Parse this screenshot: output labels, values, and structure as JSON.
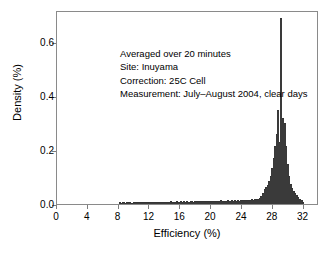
{
  "chart_data": {
    "type": "bar",
    "title": "",
    "subtitle": "",
    "xlabel": "Efficiency (%)",
    "ylabel": "Density (%)",
    "xlim": [
      0,
      34
    ],
    "ylim": [
      0.0,
      0.72
    ],
    "xticks": [
      0,
      4,
      8,
      12,
      16,
      20,
      24,
      28,
      32
    ],
    "xtick_labels": [
      "0",
      "4",
      "8",
      "12",
      "16",
      "20",
      "24",
      "28",
      "32"
    ],
    "yticks": [
      0.0,
      0.2,
      0.4,
      0.6
    ],
    "ytick_labels": [
      "0.0",
      "0.2",
      "0.4",
      "0.6"
    ],
    "grid": false,
    "legend": null,
    "bar_color": "#9a9a9a",
    "bar_edge_color": "#2e2e2e",
    "bin_width": 0.2,
    "annotations": [
      "Averaged over 20 minutes",
      "Site: Inuyama",
      "Correction: 25C Cell",
      "Measurement: July–August 2004, clear days"
    ],
    "x": [
      8.0,
      8.2,
      8.4,
      8.6,
      8.8,
      9.0,
      9.2,
      9.4,
      9.6,
      9.8,
      10.0,
      10.2,
      10.4,
      10.6,
      10.8,
      11.0,
      11.2,
      11.4,
      11.6,
      11.8,
      12.0,
      12.2,
      12.4,
      12.6,
      12.8,
      13.0,
      13.2,
      13.4,
      13.6,
      13.8,
      14.0,
      14.2,
      14.4,
      14.6,
      14.8,
      15.0,
      15.2,
      15.4,
      15.6,
      15.8,
      16.0,
      16.2,
      16.4,
      16.6,
      16.8,
      17.0,
      17.2,
      17.4,
      17.6,
      17.8,
      18.0,
      18.2,
      18.4,
      18.6,
      18.8,
      19.0,
      19.2,
      19.4,
      19.6,
      19.8,
      20.0,
      20.2,
      20.4,
      20.6,
      20.8,
      21.0,
      21.2,
      21.4,
      21.6,
      21.8,
      22.0,
      22.2,
      22.4,
      22.6,
      22.8,
      23.0,
      23.2,
      23.4,
      23.6,
      23.8,
      24.0,
      24.2,
      24.4,
      24.6,
      24.8,
      25.0,
      25.2,
      25.4,
      25.6,
      25.8,
      26.0,
      26.2,
      26.4,
      26.6,
      26.8,
      27.0,
      27.2,
      27.4,
      27.6,
      27.8,
      28.0,
      28.2,
      28.4,
      28.6,
      28.8,
      29.0,
      29.2,
      29.4,
      29.6,
      29.8,
      30.0,
      30.2,
      30.4,
      30.6,
      30.8,
      31.0,
      31.2,
      31.4,
      31.6,
      31.8
    ],
    "values": [
      0.006,
      0.005,
      0.007,
      0.006,
      0.005,
      0.008,
      0.006,
      0.007,
      0.005,
      0.006,
      0.007,
      0.006,
      0.008,
      0.006,
      0.007,
      0.006,
      0.008,
      0.007,
      0.006,
      0.008,
      0.007,
      0.009,
      0.007,
      0.008,
      0.007,
      0.009,
      0.008,
      0.007,
      0.009,
      0.008,
      0.007,
      0.009,
      0.008,
      0.01,
      0.008,
      0.009,
      0.008,
      0.01,
      0.009,
      0.008,
      0.01,
      0.009,
      0.011,
      0.009,
      0.01,
      0.009,
      0.011,
      0.01,
      0.009,
      0.011,
      0.01,
      0.012,
      0.01,
      0.011,
      0.01,
      0.012,
      0.011,
      0.01,
      0.012,
      0.011,
      0.013,
      0.011,
      0.012,
      0.011,
      0.013,
      0.012,
      0.014,
      0.012,
      0.013,
      0.012,
      0.014,
      0.013,
      0.012,
      0.014,
      0.013,
      0.015,
      0.013,
      0.014,
      0.013,
      0.015,
      0.014,
      0.016,
      0.015,
      0.014,
      0.016,
      0.015,
      0.017,
      0.016,
      0.018,
      0.017,
      0.02,
      0.024,
      0.03,
      0.04,
      0.055,
      0.062,
      0.07,
      0.085,
      0.105,
      0.135,
      0.17,
      0.215,
      0.26,
      0.35,
      0.23,
      0.69,
      0.32,
      0.3,
      0.215,
      0.15,
      0.105,
      0.075,
      0.06,
      0.048,
      0.04,
      0.032,
      0.026,
      0.02,
      0.014,
      0.008
    ]
  }
}
